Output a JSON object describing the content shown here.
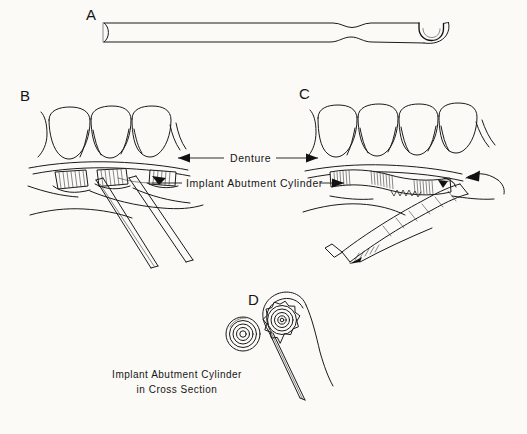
{
  "figure": {
    "background_color": "#fbfaf7",
    "ink_color": "#151515",
    "panels": [
      {
        "letter": "A",
        "name": "instrument-full-view",
        "description": "Elongated slender instrument shaft with a hooked U-shaped working tip at right end and a concave notch at the left end"
      },
      {
        "letter": "B",
        "name": "three-tooth-denture-view",
        "description": "Three-tooth denture above gingiva with separate striated implant abutment cylinders and instrument shafts inserted beneath"
      },
      {
        "letter": "C",
        "name": "four-tooth-denture-view",
        "description": "Four-tooth denture above a continuous striated implant abutment cylinder bar with instrument engaged and a curved motion arrow"
      },
      {
        "letter": "D",
        "name": "cross-section-view",
        "description": "Two concentric-ring cross sections of implant abutment cylinders, the right one encircled by the instrument hook"
      }
    ],
    "labels": {
      "denture": "Denture",
      "implant_abutment_cylinder": "Implant Abutment Cylinder"
    },
    "caption": {
      "line1": "Implant Abutment Cylinder",
      "line2": "in Cross Section"
    }
  }
}
